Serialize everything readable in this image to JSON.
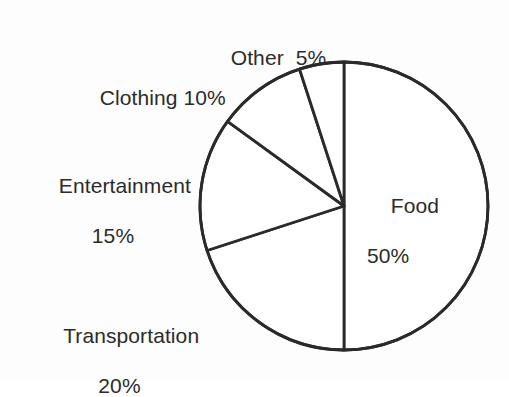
{
  "chart_data": {
    "type": "pie",
    "title": "",
    "subtitle": "",
    "xlabel": "",
    "ylabel": "",
    "unit": "%",
    "total": 100,
    "legend_position": "none",
    "grid": false,
    "start_angle_deg": 0,
    "direction": "clockwise",
    "categories": [
      "Food",
      "Transportation",
      "Entertainment",
      "Clothing",
      "Other"
    ],
    "values": [
      50,
      20,
      15,
      10,
      5
    ],
    "slices": [
      {
        "name": "Food",
        "value": 50,
        "value_label": "50%",
        "label_line1": "Food",
        "label_line2": "50%",
        "start_angle_deg": 0,
        "end_angle_deg": 180,
        "label_placement": "inside-right"
      },
      {
        "name": "Transportation",
        "value": 20,
        "value_label": "20%",
        "label_line1": "Transportation",
        "label_line2": "20%",
        "start_angle_deg": 180,
        "end_angle_deg": 252,
        "label_placement": "outside-bottom-left"
      },
      {
        "name": "Entertainment",
        "value": 15,
        "value_label": "15%",
        "label_line1": "Entertainment",
        "label_line2": "15%",
        "start_angle_deg": 252,
        "end_angle_deg": 306,
        "label_placement": "outside-left"
      },
      {
        "name": "Clothing",
        "value": 10,
        "value_label": "10%",
        "label_line1": "Clothing 10%",
        "label_line2": "",
        "start_angle_deg": 306,
        "end_angle_deg": 342,
        "label_placement": "outside-top-left"
      },
      {
        "name": "Other",
        "value": 5,
        "value_label": "5%",
        "label_line1": "Other  5%",
        "label_line2": "",
        "start_angle_deg": 342,
        "end_angle_deg": 360,
        "label_placement": "outside-top"
      }
    ]
  },
  "geometry": {
    "center_x": 344,
    "center_y": 206,
    "radius": 144
  },
  "colors": {
    "background": "#fdfdfd",
    "stroke": "#2a2a2a",
    "slice_fill": "#ffffff",
    "text": "#2b2b2b"
  }
}
